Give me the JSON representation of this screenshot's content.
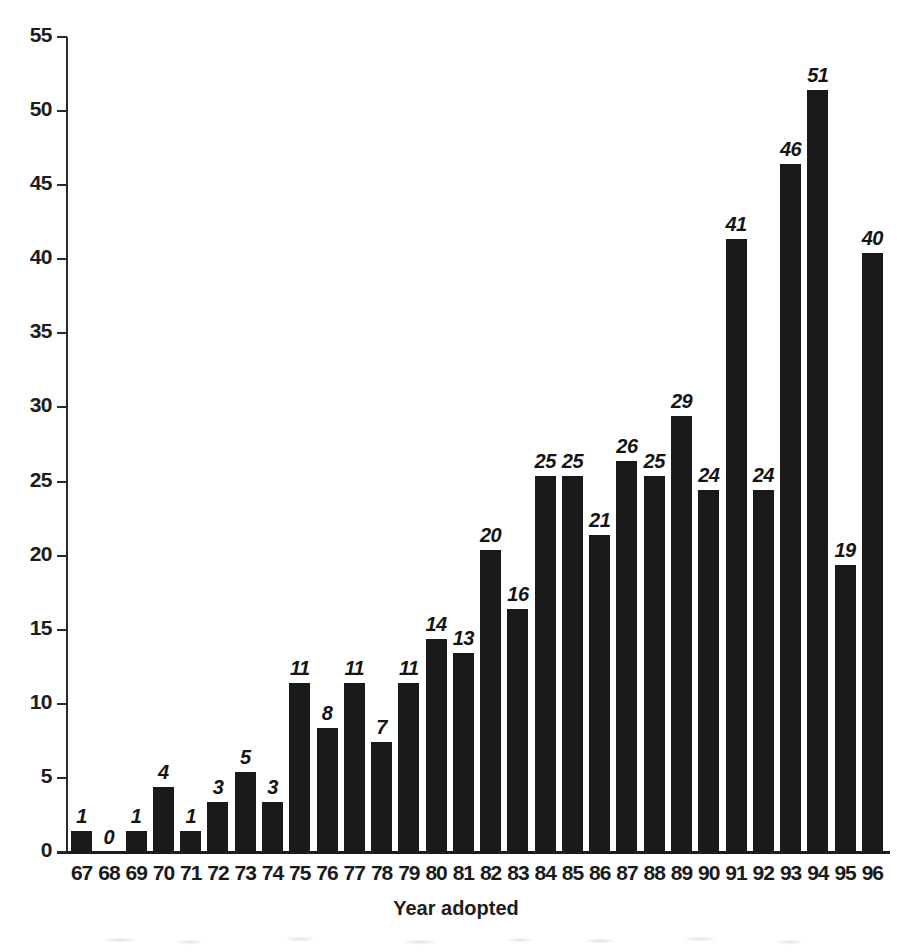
{
  "chart_data": {
    "type": "bar",
    "title": "",
    "subtitle": "",
    "xlabel": "Year adopted",
    "ylabel": "",
    "categories": [
      "67",
      "68",
      "69",
      "70",
      "71",
      "72",
      "73",
      "74",
      "75",
      "76",
      "77",
      "78",
      "79",
      "80",
      "81",
      "82",
      "83",
      "84",
      "85",
      "86",
      "87",
      "88",
      "89",
      "90",
      "91",
      "92",
      "93",
      "94",
      "95",
      "96"
    ],
    "values": [
      1,
      0,
      1,
      4,
      1,
      3,
      5,
      3,
      11,
      8,
      11,
      7,
      11,
      14,
      13,
      20,
      16,
      25,
      25,
      21,
      26,
      25,
      29,
      24,
      41,
      24,
      46,
      51,
      19,
      40
    ],
    "data_labels": [
      "1",
      "0",
      "1",
      "4",
      "1",
      "3",
      "5",
      "3",
      "11",
      "8",
      "11",
      "7",
      "11",
      "14",
      "13",
      "20",
      "16",
      "25",
      "25",
      "21",
      "26",
      "25",
      "29",
      "24",
      "41",
      "24",
      "46",
      "51",
      "19",
      "40"
    ],
    "ylim": [
      0,
      55
    ],
    "ytick_values": [
      0,
      5,
      10,
      15,
      20,
      25,
      30,
      35,
      40,
      45,
      50,
      55
    ],
    "ytick_labels": [
      "0",
      "5",
      "10",
      "15",
      "20",
      "25",
      "30",
      "35",
      "40",
      "45",
      "50",
      "55"
    ],
    "grid": false,
    "legend": null,
    "legend_position": "none",
    "bar_color": "#1a1a1a",
    "axis_color": "#1d1d1d",
    "background_color": "#ffffff",
    "label_style": "bold-italic"
  }
}
